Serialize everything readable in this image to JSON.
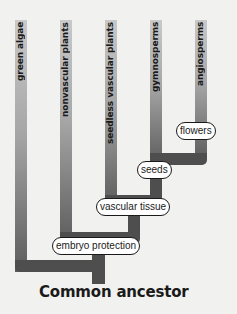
{
  "diagram": {
    "title": "Common ancestor",
    "type": "cladogram",
    "taxa": [
      {
        "id": "green-algae",
        "label": "green algae"
      },
      {
        "id": "nonvascular-plants",
        "label": "nonvascular plants"
      },
      {
        "id": "seedless-vascular-plants",
        "label": "seedless vascular plants"
      },
      {
        "id": "gymnosperms",
        "label": "gymnosperms"
      },
      {
        "id": "angiosperms",
        "label": "angiosperms"
      }
    ],
    "traits": [
      {
        "id": "embryo-protection",
        "label": "embryo protection"
      },
      {
        "id": "vascular-tissue",
        "label": "vascular tissue"
      },
      {
        "id": "seeds",
        "label": "seeds"
      },
      {
        "id": "flowers",
        "label": "flowers"
      }
    ],
    "colors": {
      "branch_dark": "#4e4e4e",
      "branch_light": "#c9c9c9",
      "background": "#f1f1ef",
      "text": "#1a1a1a"
    }
  }
}
